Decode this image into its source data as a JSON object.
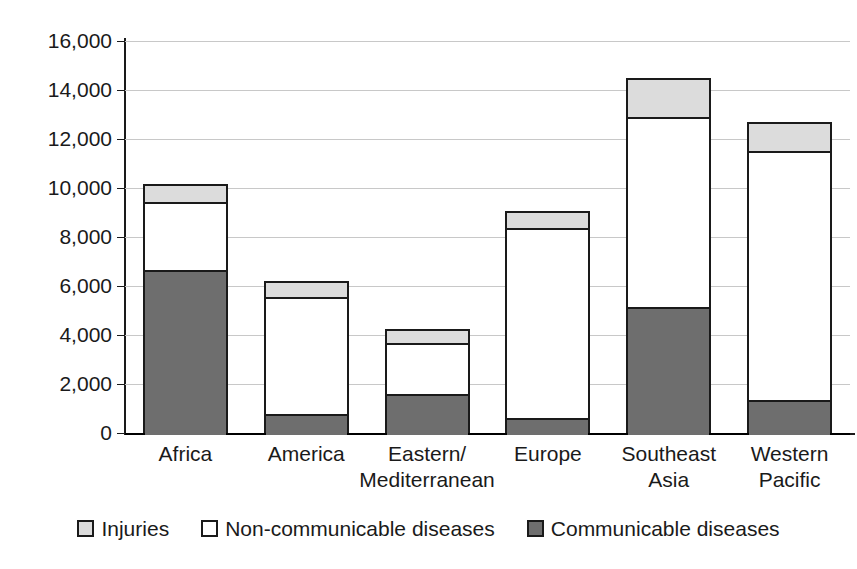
{
  "chart_data": {
    "type": "bar",
    "subtype": "stacked-bar",
    "title": "",
    "subtitle": "",
    "xlabel": "",
    "ylabel": "",
    "ylim": [
      0,
      16000
    ],
    "ytick_interval": 2000,
    "ytick_labels": [
      "16,000",
      "14,000",
      "12,000",
      "10,000",
      "8,000",
      "6,000",
      "4,000",
      "2,000",
      "0"
    ],
    "ytick_values": [
      16000,
      14000,
      12000,
      10000,
      8000,
      6000,
      4000,
      2000,
      0
    ],
    "grid": true,
    "grid_axis": "y",
    "legend_position": "bottom",
    "categories": [
      "Africa",
      "America",
      "Eastern/Mediterranean",
      "Europe",
      "Southeast Asia",
      "Western Pacific"
    ],
    "category_lines": [
      [
        "Africa",
        ""
      ],
      [
        "America",
        ""
      ],
      [
        "Eastern/",
        "Mediterranean"
      ],
      [
        "Europe",
        ""
      ],
      [
        "Southeast",
        "Asia"
      ],
      [
        "Western",
        "Pacific"
      ]
    ],
    "series": [
      {
        "name": "Communicable diseases",
        "color": "#6e6e6e",
        "values": [
          6650,
          780,
          1590,
          600,
          5150,
          1350
        ]
      },
      {
        "name": "Non-communicable diseases",
        "color": "#ffffff",
        "values": [
          2780,
          4780,
          2080,
          7750,
          7750,
          10150
        ]
      },
      {
        "name": "Injuries",
        "color": "#dcdcdc",
        "values": [
          720,
          640,
          580,
          730,
          1600,
          1200
        ]
      }
    ],
    "totals": [
      10150,
      6200,
      4250,
      9080,
      14500,
      12700
    ]
  },
  "legend": {
    "items": [
      {
        "label": "Injuries",
        "swatch": "injuries"
      },
      {
        "label": "Non-communicable diseases",
        "swatch": "noncommunicable"
      },
      {
        "label": "Communicable diseases",
        "swatch": "communicable"
      }
    ]
  },
  "colors": {
    "injuries": "#dcdcdc",
    "noncommunicable": "#ffffff",
    "communicable": "#6e6e6e",
    "axis": "#1a1a1a",
    "grid": "#c8c8c8",
    "background": "#ffffff"
  }
}
